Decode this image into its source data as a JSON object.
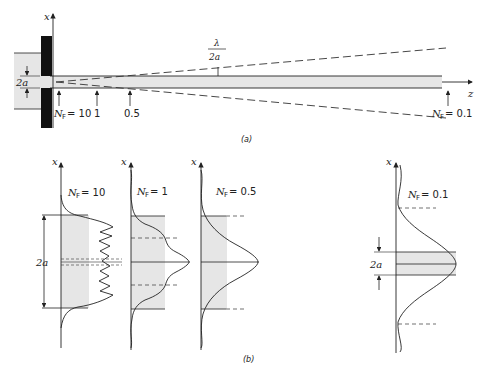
{
  "part_a": {
    "caption": "(a)",
    "x_axis_label": "x",
    "z_axis_label": "z",
    "aperture_label": "2a",
    "divergence_label_num": "λ",
    "divergence_label_den": "2a",
    "nf_markers": [
      {
        "prefix": "N",
        "sub": "F",
        "value": "= 10"
      },
      {
        "prefix": "",
        "sub": "",
        "value": "1"
      },
      {
        "prefix": "",
        "sub": "",
        "value": "0.5"
      },
      {
        "prefix": "N",
        "sub": "F",
        "value": "= 0.1"
      }
    ]
  },
  "part_b": {
    "caption": "(b)",
    "aperture_label": "2a",
    "panels": [
      {
        "axis": "x",
        "nf_prefix": "N",
        "nf_sub": "F",
        "nf_value": "= 10"
      },
      {
        "axis": "x",
        "nf_prefix": "N",
        "nf_sub": "F",
        "nf_value": "= 1"
      },
      {
        "axis": "x",
        "nf_prefix": "N",
        "nf_sub": "F",
        "nf_value": "= 0.5"
      },
      {
        "axis": "x",
        "nf_prefix": "N",
        "nf_sub": "F",
        "nf_value": "= 0.1"
      }
    ]
  },
  "colors": {
    "ink": "#222222",
    "shade": "#e6e6e6",
    "screen": "#111111"
  }
}
